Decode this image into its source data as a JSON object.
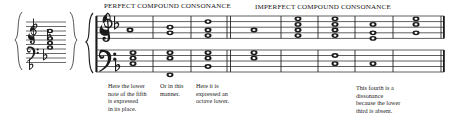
{
  "figure": {
    "kind": "music-notation-figure",
    "headings": [
      {
        "id": "perfect",
        "label": "PERFECT COMPOUND CONSONANCE"
      },
      {
        "id": "imperfect",
        "label": "IMPERFECT COMPOUND CONSONANCE"
      }
    ],
    "captions": [
      {
        "id": "caption-lower-note-of-fifth",
        "text": "Here the lower\nnote of the fifth\nis expressed\nin its place."
      },
      {
        "id": "caption-or-in-this-manner",
        "text": "Or in this\nmanner."
      },
      {
        "id": "caption-octave-lower",
        "text": "Here it is\nexpressed an\noctave lower."
      },
      {
        "id": "caption-fourth-dissonance",
        "text": "This fourth is a\ndissonance\nbecause the lower\nthird is absent."
      }
    ],
    "left_cluster": {
      "id": "compressed-staff-cluster",
      "clefs": [
        "treble-clef",
        "bass-clef"
      ],
      "accidentals": [
        "flat",
        "flat",
        "flat",
        "flat"
      ],
      "chord_stack_notes": 4
    },
    "system": {
      "brace": "curly-brace",
      "staves": [
        {
          "id": "treble-staff",
          "clef": "treble-clef",
          "key_signature": [
            "flat"
          ]
        },
        {
          "id": "bass-staff",
          "clef": "bass-clef",
          "key_signature": [
            "flat"
          ]
        }
      ],
      "measures": [
        {
          "index": 1,
          "treble": [
            "whole-note"
          ],
          "bass": [
            "whole-note",
            "whole-note",
            "whole-note"
          ]
        },
        {
          "index": 2,
          "treble": [
            "whole-note",
            "whole-note"
          ],
          "bass": [
            "whole-note",
            "whole-note",
            "whole-note-below-staff"
          ]
        },
        {
          "index": 3,
          "treble": [
            "whole-note",
            "whole-note",
            "whole-note"
          ],
          "bass": [
            "whole-note",
            "whole-note",
            "whole-note"
          ]
        },
        {
          "index": 4,
          "treble": [
            "whole-note"
          ],
          "bass": [
            "whole-note",
            "whole-note"
          ]
        },
        {
          "index": 5,
          "treble": [
            "whole-note",
            "whole-note",
            "whole-note",
            "whole-note"
          ],
          "bass": []
        },
        {
          "index": 6,
          "treble": [
            "whole-note",
            "whole-note",
            "whole-note",
            "whole-note"
          ],
          "bass": [
            "whole-note",
            "whole-note"
          ]
        },
        {
          "index": 7,
          "treble": [
            "whole-note",
            "whole-note",
            "whole-note"
          ],
          "bass": [
            "whole-note"
          ]
        },
        {
          "index": 8,
          "treble": [
            "whole-note",
            "whole-note",
            "whole-note"
          ],
          "bass": []
        }
      ],
      "barline_double_after_measure": 3
    },
    "colors": {
      "ink": "#1a1a1a",
      "staff_line": "#2b2b2b",
      "paper": "#ffffff"
    }
  }
}
